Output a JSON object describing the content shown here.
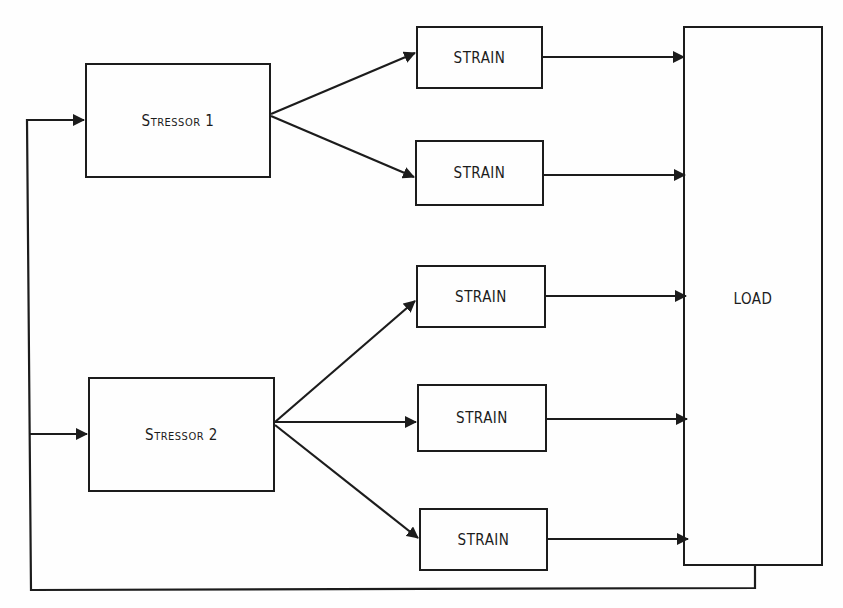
{
  "diagram": {
    "type": "block-flow",
    "stressors": [
      {
        "id": "stressor-1",
        "label": "Stressor 1"
      },
      {
        "id": "stressor-2",
        "label": "Stressor 2"
      }
    ],
    "strains": [
      {
        "id": "strain-1",
        "label": "STRAIN",
        "from": "stressor-1"
      },
      {
        "id": "strain-2",
        "label": "STRAIN",
        "from": "stressor-1"
      },
      {
        "id": "strain-3",
        "label": "STRAIN",
        "from": "stressor-2"
      },
      {
        "id": "strain-4",
        "label": "STRAIN",
        "from": "stressor-2"
      },
      {
        "id": "strain-5",
        "label": "STRAIN",
        "from": "stressor-2"
      }
    ],
    "load": {
      "id": "load",
      "label": "LOAD"
    },
    "edges": [
      {
        "from": "stressor-1",
        "to": "strain-1"
      },
      {
        "from": "stressor-1",
        "to": "strain-2"
      },
      {
        "from": "stressor-2",
        "to": "strain-3"
      },
      {
        "from": "stressor-2",
        "to": "strain-4"
      },
      {
        "from": "stressor-2",
        "to": "strain-5"
      },
      {
        "from": "strain-1",
        "to": "load"
      },
      {
        "from": "strain-2",
        "to": "load"
      },
      {
        "from": "strain-3",
        "to": "load"
      },
      {
        "from": "strain-4",
        "to": "load"
      },
      {
        "from": "strain-5",
        "to": "load"
      },
      {
        "from": "load",
        "to": "stressor-1",
        "kind": "feedback"
      },
      {
        "from": "load",
        "to": "stressor-2",
        "kind": "feedback"
      }
    ],
    "colors": {
      "line": "#1c1c1c",
      "background": "#fefefe"
    }
  }
}
